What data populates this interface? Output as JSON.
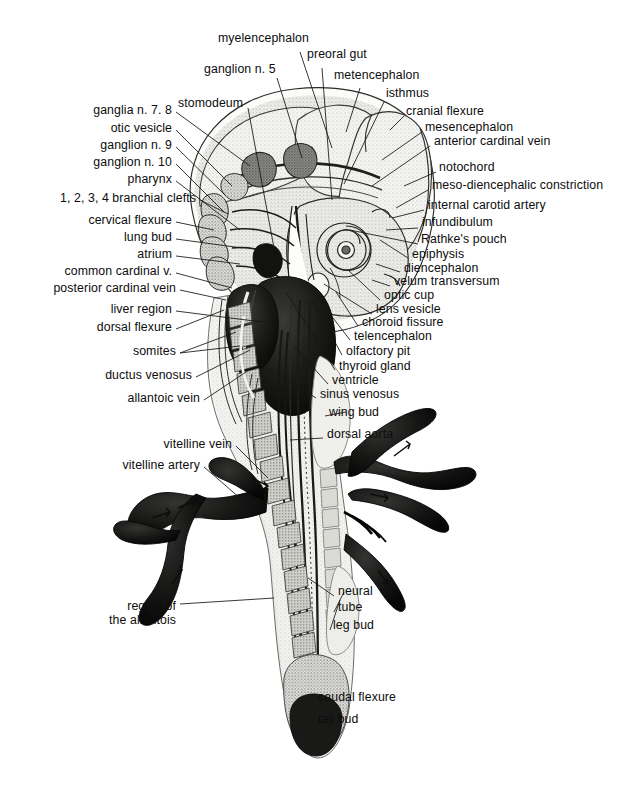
{
  "figure": {
    "orientation": "head superior, tail inferior",
    "background_color": "#ffffff",
    "ink_color": "#111111"
  },
  "labels_left": [
    {
      "id": "ganglia-n-7-8",
      "text": "ganglia n. 7. 8",
      "x": 172,
      "y": 112,
      "anchor": "right"
    },
    {
      "id": "otic-vesicle",
      "text": "otic vesicle",
      "x": 172,
      "y": 130,
      "anchor": "right"
    },
    {
      "id": "ganglion-n-9",
      "text": "ganglion n. 9",
      "x": 172,
      "y": 147,
      "anchor": "right"
    },
    {
      "id": "ganglion-n-10",
      "text": "ganglion n. 10",
      "x": 172,
      "y": 164,
      "anchor": "right"
    },
    {
      "id": "pharynx",
      "text": "pharynx",
      "x": 172,
      "y": 181,
      "anchor": "right"
    },
    {
      "id": "branchial-clefts",
      "text": "1, 2, 3, 4 branchial clefts",
      "x": 196,
      "y": 200,
      "anchor": "right"
    },
    {
      "id": "cervical-flexure",
      "text": "cervical flexure",
      "x": 172,
      "y": 222,
      "anchor": "right"
    },
    {
      "id": "lung-bud",
      "text": "lung bud",
      "x": 172,
      "y": 239,
      "anchor": "right"
    },
    {
      "id": "atrium",
      "text": "atrium",
      "x": 172,
      "y": 256,
      "anchor": "right"
    },
    {
      "id": "common-cardinal-v",
      "text": "common cardinal v.",
      "x": 172,
      "y": 273,
      "anchor": "right"
    },
    {
      "id": "posterior-cardinal-vein",
      "text": "posterior cardinal vein",
      "x": 176,
      "y": 290,
      "anchor": "right"
    },
    {
      "id": "liver-region",
      "text": "liver region",
      "x": 172,
      "y": 311,
      "anchor": "right"
    },
    {
      "id": "dorsal-flexure",
      "text": "dorsal flexure",
      "x": 172,
      "y": 329,
      "anchor": "right"
    },
    {
      "id": "somites",
      "text": "somites",
      "x": 176,
      "y": 353,
      "anchor": "right"
    },
    {
      "id": "ductus-venosus",
      "text": "ductus venosus",
      "x": 192,
      "y": 377,
      "anchor": "right"
    },
    {
      "id": "allantoic-vein",
      "text": "allantoic vein",
      "x": 200,
      "y": 400,
      "anchor": "right"
    },
    {
      "id": "vitelline-vein",
      "text": "vitelline vein",
      "x": 232,
      "y": 446,
      "anchor": "right"
    },
    {
      "id": "vitelline-artery",
      "text": "vitelline artery",
      "x": 200,
      "y": 467,
      "anchor": "right"
    }
  ],
  "labels_left_multiline": [
    {
      "id": "region-of-the-allantois",
      "line1": "region of",
      "line2": "the allantois",
      "x": 176,
      "y": 607,
      "anchor": "right"
    }
  ],
  "labels_top": [
    {
      "id": "myelencephalon",
      "text": "myelencephalon",
      "x": 218,
      "y": 40,
      "anchor": "left"
    },
    {
      "id": "preoral-gut",
      "text": "preoral gut",
      "x": 307,
      "y": 56,
      "anchor": "left"
    },
    {
      "id": "ganglion-n-5",
      "text": "ganglion n. 5",
      "x": 204,
      "y": 71,
      "anchor": "left"
    },
    {
      "id": "metencephalon",
      "text": "metencephalon",
      "x": 334,
      "y": 77,
      "anchor": "left"
    },
    {
      "id": "stomodeum",
      "text": "stomodeum",
      "x": 178,
      "y": 105,
      "anchor": "left"
    },
    {
      "id": "isthmus",
      "text": "isthmus",
      "x": 386,
      "y": 95,
      "anchor": "left"
    }
  ],
  "labels_right": [
    {
      "id": "cranial-flexure",
      "text": "cranial flexure",
      "x": 406,
      "y": 113,
      "anchor": "left"
    },
    {
      "id": "mesencephalon",
      "text": "mesencephalon",
      "x": 425,
      "y": 129,
      "anchor": "left"
    },
    {
      "id": "anterior-cardinal-vein",
      "text": "anterior cardinal vein",
      "x": 434,
      "y": 143,
      "anchor": "left"
    },
    {
      "id": "notochord",
      "text": "notochord",
      "x": 439,
      "y": 169,
      "anchor": "left"
    },
    {
      "id": "meso-diencephalic-constriction",
      "text": "meso-diencephalic constriction",
      "x": 432,
      "y": 187,
      "anchor": "left"
    },
    {
      "id": "internal-carotid-artery",
      "text": "internal carotid artery",
      "x": 428,
      "y": 207,
      "anchor": "left"
    },
    {
      "id": "infundibulum",
      "text": "infundibulum",
      "x": 422,
      "y": 224,
      "anchor": "left"
    },
    {
      "id": "rathkes-pouch",
      "text": "Rathke's pouch",
      "x": 421,
      "y": 241,
      "anchor": "left"
    },
    {
      "id": "epiphysis",
      "text": "epiphysis",
      "x": 412,
      "y": 256,
      "anchor": "left"
    },
    {
      "id": "diencephalon",
      "text": "diencephalon",
      "x": 404,
      "y": 270,
      "anchor": "left"
    },
    {
      "id": "velum-transversum",
      "text": "velum transversum",
      "x": 394,
      "y": 283,
      "anchor": "left"
    },
    {
      "id": "optic-cup",
      "text": "optic cup",
      "x": 384,
      "y": 297,
      "anchor": "left"
    },
    {
      "id": "lens-vesicle",
      "text": "lens vesicle",
      "x": 376,
      "y": 311,
      "anchor": "left"
    },
    {
      "id": "choroid-fissure",
      "text": "choroid fissure",
      "x": 362,
      "y": 324,
      "anchor": "left"
    },
    {
      "id": "telencephalon",
      "text": "telencephalon",
      "x": 354,
      "y": 338,
      "anchor": "left"
    },
    {
      "id": "olfactory-pit",
      "text": "olfactory pit",
      "x": 346,
      "y": 353,
      "anchor": "left"
    },
    {
      "id": "thyroid-gland",
      "text": "thyroid gland",
      "x": 339,
      "y": 368,
      "anchor": "left"
    },
    {
      "id": "ventricle",
      "text": "ventricle",
      "x": 332,
      "y": 382,
      "anchor": "left"
    },
    {
      "id": "sinus-venosus",
      "text": "sinus venosus",
      "x": 320,
      "y": 396,
      "anchor": "left"
    },
    {
      "id": "wing-bud",
      "text": "wing bud",
      "x": 329,
      "y": 414,
      "anchor": "left"
    },
    {
      "id": "dorsal-aorta",
      "text": "dorsal aorta",
      "x": 327,
      "y": 436,
      "anchor": "left"
    }
  ],
  "labels_bottom_right": [
    {
      "id": "neural",
      "text": "neural",
      "x": 338,
      "y": 593,
      "anchor": "left"
    },
    {
      "id": "tube",
      "text": "tube",
      "x": 338,
      "y": 609,
      "anchor": "left"
    },
    {
      "id": "leg-bud",
      "text": "leg bud",
      "x": 333,
      "y": 627,
      "anchor": "left"
    },
    {
      "id": "caudal-flexure",
      "text": "caudal flexure",
      "x": 318,
      "y": 699,
      "anchor": "left"
    },
    {
      "id": "tail-bud",
      "text": "tail bud",
      "x": 318,
      "y": 721,
      "anchor": "left"
    }
  ],
  "leaders": {
    "stroke_color": "#141414",
    "stroke_width": 0.85,
    "count": 46
  }
}
